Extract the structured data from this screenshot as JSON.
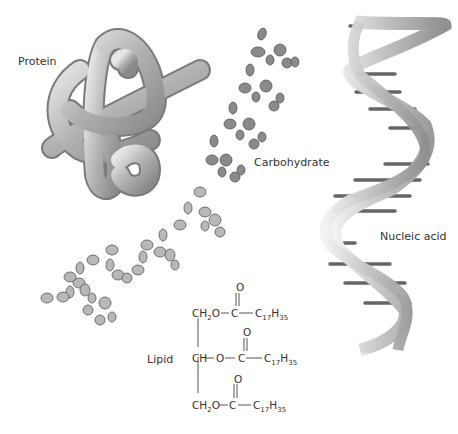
{
  "diagram": {
    "labels": {
      "protein": "Protein",
      "carbohydrate": "Carbohydrate",
      "nucleic_acid": "Nucleic acid",
      "lipid": "Lipid"
    },
    "lipid_structure": {
      "backbone": [
        "CH2O",
        "CH",
        "CH2O"
      ],
      "rows": [
        {
          "left": "CH",
          "left_sub": "2",
          "left_tail": "O",
          "link": "C",
          "double_bond_atom": "O",
          "chain": "C",
          "chain_sub1": "17",
          "chain_mid": "H",
          "chain_sub2": "35"
        },
        {
          "left": "CH",
          "left_sub": "",
          "left_tail": "",
          "link_prefix": "O",
          "link": "C",
          "double_bond_atom": "O",
          "chain": "C",
          "chain_sub1": "17",
          "chain_mid": "H",
          "chain_sub2": "35"
        },
        {
          "left": "CH",
          "left_sub": "2",
          "left_tail": "O",
          "link": "C",
          "double_bond_atom": "O",
          "chain": "C",
          "chain_sub1": "17",
          "chain_mid": "H",
          "chain_sub2": "35"
        }
      ]
    },
    "colors": {
      "protein_tube": "#b8b8b8",
      "carb_dark": "#7d7d7d",
      "carb_light": "#b5b5b5",
      "dna_ribbon": "#c8c8c8",
      "text": "#333333"
    }
  }
}
